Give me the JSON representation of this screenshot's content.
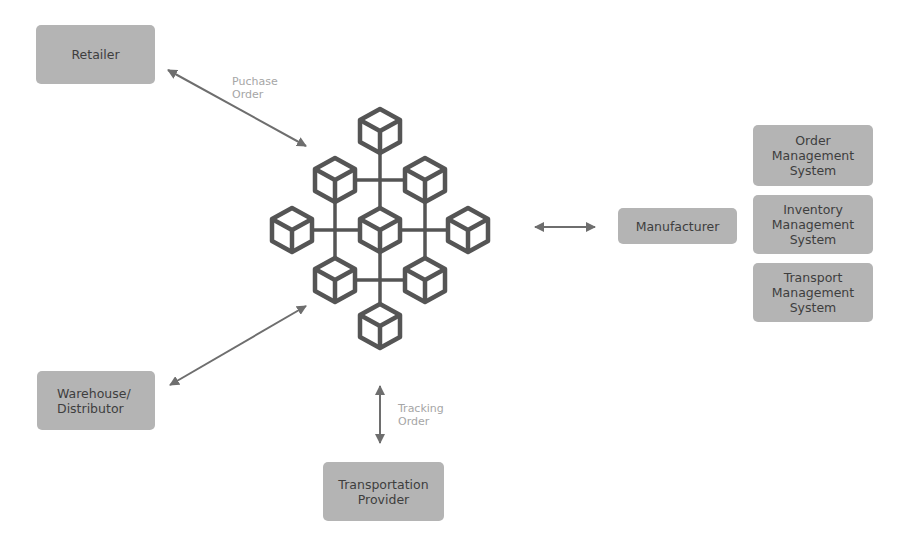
{
  "diagram": {
    "colors": {
      "node_fill": "#b4b4b4",
      "node_text": "#3e3e3e",
      "edge": "#6e6e6e",
      "edge_label": "#a6a6a6",
      "cube_stroke": "#555555"
    },
    "nodes": {
      "retailer": {
        "lines": [
          "Retailer"
        ]
      },
      "warehouse": {
        "lines": [
          "Warehouse/",
          "Distributor"
        ]
      },
      "transport_provider": {
        "lines": [
          "Transportation",
          "Provider"
        ]
      },
      "manufacturer": {
        "lines": [
          "Manufacturer"
        ]
      },
      "order_mgmt": {
        "lines": [
          "Order",
          "Management",
          "System"
        ]
      },
      "inventory_mgmt": {
        "lines": [
          "Inventory",
          "Management",
          "System"
        ]
      },
      "transport_mgmt": {
        "lines": [
          "Transport",
          "Management",
          "System"
        ]
      }
    },
    "edges": {
      "retailer_to_chain": {
        "label_lines": [
          "Puchase",
          "Order"
        ],
        "direction": "bidirectional"
      },
      "warehouse_to_chain": {
        "label_lines": [],
        "direction": "bidirectional"
      },
      "transport_to_chain": {
        "label_lines": [
          "Tracking",
          "Order"
        ],
        "direction": "bidirectional"
      },
      "manufacturer_to_chain": {
        "label_lines": [],
        "direction": "bidirectional"
      }
    },
    "blockchain": {
      "icon": "blockchain-cube-network-icon",
      "cube_count": 9
    }
  }
}
